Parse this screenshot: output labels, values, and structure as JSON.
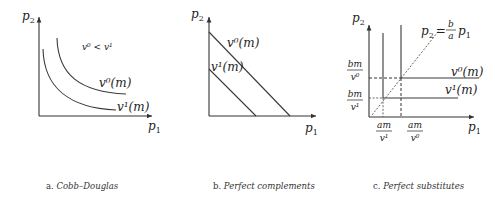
{
  "panels": [
    {
      "id": "a",
      "caption_letter": "a.",
      "caption_text": "Cobb–Douglas",
      "y_axis": "p",
      "y_axis_sub": "2",
      "x_axis": "p",
      "x_axis_sub": "1",
      "annotation": "v⁰ < v¹",
      "curves": [
        {
          "label": "v⁰(m)"
        },
        {
          "label": "v¹(m)"
        }
      ]
    },
    {
      "id": "b",
      "caption_letter": "b.",
      "caption_text": "Perfect complements",
      "y_axis": "p",
      "y_axis_sub": "2",
      "x_axis": "p",
      "x_axis_sub": "1",
      "curves": [
        {
          "label": "v⁰(m)"
        },
        {
          "label": "v¹(m)"
        }
      ]
    },
    {
      "id": "c",
      "caption_letter": "c.",
      "caption_text": "Perfect substitutes",
      "y_axis": "p",
      "y_axis_sub": "2",
      "x_axis": "p",
      "x_axis_sub": "1",
      "diagonal_label_lhs": "p",
      "diagonal_label_lhs_sub": "2",
      "diagonal_label_eq": "=",
      "diagonal_frac_num": "b",
      "diagonal_frac_den": "a",
      "diagonal_label_rhs": "p",
      "diagonal_label_rhs_sub": "1",
      "y_ticks": [
        {
          "num": "bm",
          "den": "v⁰"
        },
        {
          "num": "bm",
          "den": "v¹"
        }
      ],
      "x_ticks": [
        {
          "num": "am",
          "den": "v¹"
        },
        {
          "num": "am",
          "den": "v⁰"
        }
      ],
      "curves": [
        {
          "label": "v⁰(m)"
        },
        {
          "label": "v¹(m)"
        }
      ]
    }
  ]
}
